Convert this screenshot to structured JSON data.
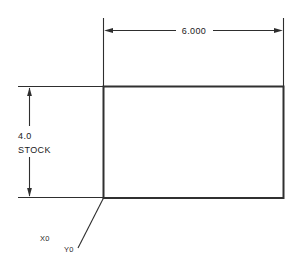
{
  "drawing": {
    "title": "Stock rectangle dimensioned drawing",
    "background_color": "#ffffff",
    "line_color": "#2e2e2e",
    "part_outline_color": "#303030",
    "text_color": "#1a1a1a",
    "part": {
      "name": "stock-rectangle",
      "left": 103,
      "top": 86,
      "right": 283,
      "bottom": 198,
      "width_px": 180,
      "height_px": 112
    },
    "dimensions": [
      {
        "id": "width-dimension",
        "orientation": "horizontal",
        "label": "6.000",
        "value": 6.0,
        "units": "in",
        "dim_line_y": 30,
        "ext_line_top": 18,
        "ext_line_x_start": 103,
        "ext_line_x_end": 283,
        "arrow_direction": "outward"
      },
      {
        "id": "height-dimension",
        "orientation": "vertical",
        "label_line_1": "4.0",
        "label_line_2": "STOCK",
        "value": 4.0,
        "units": "in",
        "dim_line_x": 29,
        "ext_line_left": 18,
        "ext_line_y_start": 86,
        "ext_line_y_end": 198,
        "arrow_direction": "inward"
      }
    ],
    "origin_marker": {
      "id": "program-origin",
      "leader_from_x": 103,
      "leader_from_y": 198,
      "leader_to_x": 78,
      "leader_to_y": 248,
      "x_label": "X0",
      "y_label": "Y0"
    }
  }
}
